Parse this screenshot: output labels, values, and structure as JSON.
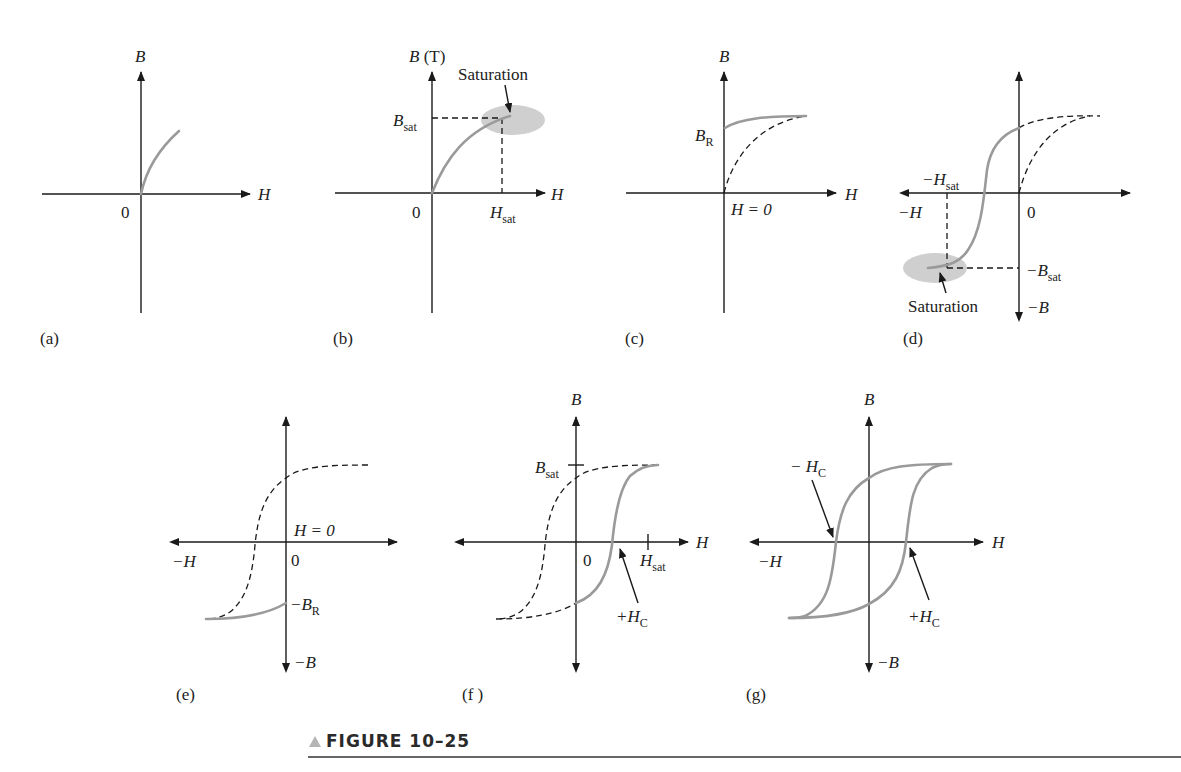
{
  "figure": {
    "caption": "FIGURE 10–25",
    "caption_marker": "triangle-icon",
    "colors": {
      "curve_solid": "#9a9a9a",
      "saturation_ellipse": "#cfcfcf",
      "axes": "#1a1a1a"
    }
  },
  "panels": {
    "a": {
      "label": "(a)",
      "y_axis": "B",
      "x_axis": "H",
      "origin": "0"
    },
    "b": {
      "label": "(b)",
      "y_axis": "B",
      "y_unit": "(T)",
      "x_axis": "H",
      "origin": "0",
      "bsat": "B",
      "bsat_sub": "sat",
      "hsat": "H",
      "hsat_sub": "sat",
      "annotation": "Saturation"
    },
    "c": {
      "label": "(c)",
      "y_axis": "B",
      "x_axis": "H",
      "br": "B",
      "br_sub": "R",
      "h_zero": "H = 0"
    },
    "d": {
      "label": "(d)",
      "x_neg": "−H",
      "origin": "0",
      "neg_hsat": "−H",
      "neg_hsat_sub": "sat",
      "neg_bsat": "−B",
      "neg_bsat_sub": "sat",
      "y_neg": "−B",
      "annotation": "Saturation"
    },
    "e": {
      "label": "(e)",
      "x_neg": "−H",
      "origin": "0",
      "h_zero": "H = 0",
      "neg_br": "−B",
      "neg_br_sub": "R",
      "y_neg": "−B"
    },
    "f": {
      "label": "(f )",
      "y_axis": "B",
      "x_axis": "H",
      "origin": "0",
      "bsat": "B",
      "bsat_sub": "sat",
      "hsat": "H",
      "hsat_sub": "sat",
      "pos_hc": "+H",
      "pos_hc_sub": "C"
    },
    "g": {
      "label": "(g)",
      "y_axis": "B",
      "x_axis": "H",
      "x_neg": "−H",
      "y_neg": "−B",
      "neg_hc": "− H",
      "neg_hc_sub": "C",
      "pos_hc": "+H",
      "pos_hc_sub": "C"
    }
  }
}
